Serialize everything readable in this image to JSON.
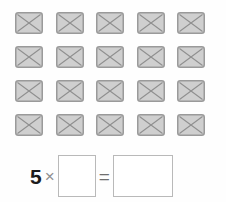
{
  "canvas": {
    "width": 226,
    "height": 202,
    "background_color": "#fefefe"
  },
  "icon_grid": {
    "columns": 5,
    "rows": 4,
    "total_icons": 20,
    "icon_name": "broken-image-placeholder-icon",
    "icon_fill_color": "#cfcfcf",
    "icon_border_color": "#9a9a9a",
    "icon_cross_color": "#8f8f8f",
    "icon_width": 28,
    "icon_height": 22,
    "cells": [
      [
        {
          "name": "placeholder-icon-r1c1"
        },
        {
          "name": "placeholder-icon-r1c2"
        },
        {
          "name": "placeholder-icon-r1c3"
        },
        {
          "name": "placeholder-icon-r1c4"
        },
        {
          "name": "placeholder-icon-r1c5"
        }
      ],
      [
        {
          "name": "placeholder-icon-r2c1"
        },
        {
          "name": "placeholder-icon-r2c2"
        },
        {
          "name": "placeholder-icon-r2c3"
        },
        {
          "name": "placeholder-icon-r2c4"
        },
        {
          "name": "placeholder-icon-r2c5"
        }
      ],
      [
        {
          "name": "placeholder-icon-r3c1"
        },
        {
          "name": "placeholder-icon-r3c2"
        },
        {
          "name": "placeholder-icon-r3c3"
        },
        {
          "name": "placeholder-icon-r3c4"
        },
        {
          "name": "placeholder-icon-r3c5"
        }
      ],
      [
        {
          "name": "placeholder-icon-r4c1"
        },
        {
          "name": "placeholder-icon-r4c2"
        },
        {
          "name": "placeholder-icon-r4c3"
        },
        {
          "name": "placeholder-icon-r4c4"
        },
        {
          "name": "placeholder-icon-r4c5"
        }
      ]
    ]
  },
  "equation": {
    "multiplier": "5",
    "times_symbol": "×",
    "equals_symbol": "=",
    "factor_box": {
      "value": "",
      "placeholder": ""
    },
    "product_box": {
      "value": "",
      "placeholder": ""
    },
    "box_border_color": "#b9b9b9",
    "number_color": "#1c1c1c",
    "symbol_color": "#8e8e8e"
  }
}
